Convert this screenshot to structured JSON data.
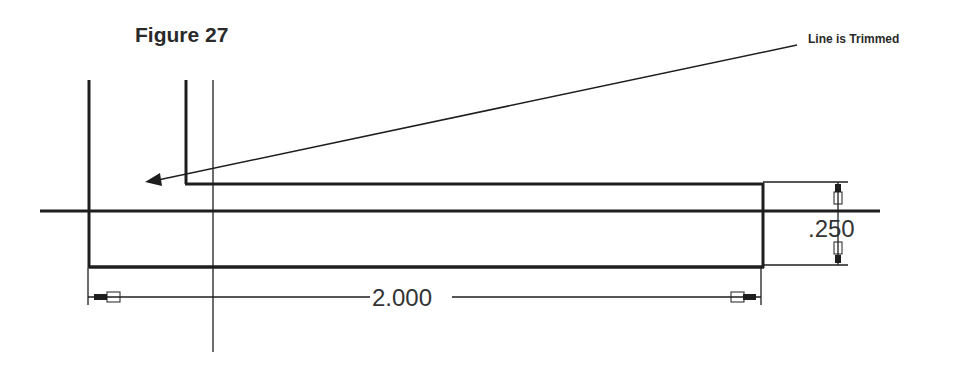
{
  "figure": {
    "title": "Figure 27",
    "callout": "Line is Trimmed"
  },
  "dimensions": {
    "length": "2.000",
    "height": ".250"
  },
  "colors": {
    "line": "#1e1e1e",
    "text": "#2a2a2a"
  }
}
